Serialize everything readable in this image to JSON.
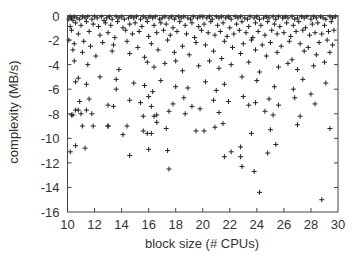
{
  "chart_data": {
    "type": "scatter",
    "title": "",
    "xlabel": "block size (# CPUs)",
    "ylabel": "complexity (MB/s)",
    "xlim": [
      10,
      30
    ],
    "ylim": [
      -16,
      0
    ],
    "xticks": [
      10,
      12,
      14,
      16,
      18,
      20,
      22,
      24,
      26,
      28,
      30
    ],
    "yticks": [
      0,
      -2,
      -4,
      -6,
      -8,
      -10,
      -12,
      -14,
      -16
    ],
    "grid": false,
    "legend": null,
    "marker": "+",
    "marker_color": "#222222",
    "series": [
      {
        "name": "points",
        "x": [
          10.1,
          10.2,
          10.3,
          10.4,
          10.5,
          10.7,
          10.9,
          11.1,
          11.3,
          11.5,
          11.8,
          12.0,
          12.2,
          12.5,
          12.7,
          12.9,
          13.1,
          13.3,
          13.6,
          13.8,
          14.0,
          14.2,
          14.5,
          14.7,
          14.9,
          15.1,
          15.4,
          15.6,
          15.8,
          16.1,
          16.3,
          16.5,
          16.8,
          17.0,
          17.2,
          17.5,
          17.7,
          17.9,
          18.2,
          18.4,
          18.6,
          18.9,
          19.1,
          19.3,
          19.6,
          19.8,
          20.0,
          20.3,
          20.5,
          20.7,
          21.0,
          21.2,
          21.4,
          21.7,
          21.9,
          22.1,
          22.4,
          22.6,
          22.8,
          23.1,
          23.3,
          23.5,
          23.8,
          24.0,
          24.2,
          24.5,
          24.7,
          24.9,
          25.2,
          25.4,
          25.6,
          25.9,
          26.1,
          26.3,
          26.6,
          26.8,
          27.0,
          27.3,
          27.5,
          27.7,
          28.0,
          28.2,
          28.4,
          28.7,
          28.9,
          29.1,
          29.4,
          29.6,
          29.8,
          10.2,
          10.6,
          11.0,
          11.4,
          11.9,
          12.3,
          12.8,
          13.2,
          13.7,
          14.1,
          14.6,
          15.0,
          15.5,
          15.9,
          16.4,
          16.9,
          17.3,
          17.8,
          18.3,
          18.7,
          19.2,
          19.7,
          20.1,
          20.6,
          21.1,
          21.5,
          22.0,
          22.5,
          22.9,
          23.4,
          23.9,
          24.3,
          24.8,
          25.3,
          25.7,
          26.2,
          26.7,
          27.1,
          27.6,
          28.1,
          28.5,
          29.0,
          29.5,
          10.3,
          10.8,
          11.6,
          12.4,
          13.0,
          13.5,
          14.3,
          14.8,
          15.3,
          16.0,
          16.6,
          17.1,
          17.6,
          18.1,
          18.8,
          19.4,
          19.9,
          20.4,
          20.9,
          21.3,
          21.8,
          22.3,
          22.7,
          23.2,
          23.7,
          24.1,
          24.6,
          25.1,
          25.5,
          26.0,
          26.5,
          26.9,
          27.4,
          27.9,
          28.3,
          28.8,
          29.3,
          29.7,
          10.1,
          10.5,
          11.2,
          11.7,
          12.6,
          13.4,
          14.4,
          15.2,
          16.2,
          17.4,
          18.5,
          19.5,
          20.2,
          21.6,
          22.2,
          23.0,
          23.6,
          24.4,
          25.0,
          25.8,
          26.4,
          27.2,
          27.8,
          28.6,
          29.2,
          29.6,
          10.4,
          11.1,
          12.1,
          13.3,
          14.6,
          15.7,
          16.7,
          17.9,
          18.0,
          19.0,
          20.8,
          21.4,
          22.8,
          23.9,
          24.7,
          25.5,
          26.6,
          27.5,
          28.4,
          29.4,
          10.5,
          11.5,
          13.8,
          15.9,
          16.4,
          17.2,
          18.5,
          19.7,
          20.5,
          21.2,
          22.1,
          23.4,
          24.2,
          25.6,
          26.3,
          27.0,
          28.2,
          29.0,
          10.6,
          10.8,
          11.4,
          12.4,
          13.6,
          13.6,
          14.9,
          15.7,
          16.3,
          16.9,
          18.0,
          18.9,
          20.2,
          21.0,
          21.6,
          22.9,
          24.0,
          25.3,
          26.7,
          27.4,
          28.0,
          29.1,
          10.9,
          11.6,
          13.0,
          14.6,
          15.4,
          16.0,
          17.8,
          18.6,
          19.2,
          20.8,
          21.9,
          23.0,
          23.9,
          24.9,
          25.6,
          26.8,
          28.3,
          10.3,
          10.8,
          11.8,
          13.4,
          15.6,
          16.6,
          17.5,
          18.7,
          19.8,
          21.2,
          23.4,
          24.6,
          25.2,
          27.2,
          11.1,
          11.9,
          13.0,
          14.1,
          15.6,
          16.2,
          16.6,
          17.3,
          19.5,
          20.9,
          21.5,
          23.6,
          25.0,
          27.0,
          29.4,
          10.2,
          10.6,
          11.3,
          14.6,
          16.0,
          17.4,
          21.6,
          22.8,
          24.8,
          25.4,
          10.4,
          10.6,
          11.0,
          11.4,
          13.0,
          14.4,
          15.9,
          16.2,
          16.4,
          17.5,
          20.1,
          22.1,
          22.8,
          22.9,
          23.8,
          24.2,
          28.8
        ],
        "y": [
          -0.3,
          -0.1,
          -0.2,
          -0.4,
          -0.1,
          -0.2,
          -0.3,
          -0.1,
          -0.2,
          -0.1,
          -0.3,
          -0.1,
          -0.2,
          -0.1,
          -0.4,
          -0.2,
          -0.1,
          -0.3,
          -0.1,
          -0.2,
          -0.1,
          -0.3,
          -0.2,
          -0.1,
          -0.2,
          -0.1,
          -0.3,
          -0.1,
          -0.2,
          -0.1,
          -0.2,
          -0.1,
          -0.3,
          -0.2,
          -0.1,
          -0.2,
          -0.1,
          -0.3,
          -0.1,
          -0.2,
          -0.1,
          -0.2,
          -0.3,
          -0.1,
          -0.2,
          -0.1,
          -0.1,
          -0.2,
          -0.1,
          -0.3,
          -0.1,
          -0.2,
          -0.1,
          -0.2,
          -0.1,
          -0.3,
          -0.1,
          -0.2,
          -0.1,
          -0.2,
          -0.3,
          -0.1,
          -0.2,
          -0.1,
          -0.3,
          -0.2,
          -0.1,
          -0.2,
          -0.1,
          -0.3,
          -0.1,
          -0.2,
          -0.1,
          -0.2,
          -0.1,
          -0.3,
          -0.2,
          -0.1,
          -0.2,
          -0.1,
          -0.3,
          -0.1,
          -0.2,
          -0.1,
          -0.2,
          -0.3,
          -0.1,
          -0.2,
          -0.1,
          -0.9,
          -0.6,
          -0.8,
          -0.5,
          -0.7,
          -0.9,
          -0.6,
          -0.8,
          -0.5,
          -1.0,
          -0.7,
          -0.6,
          -0.9,
          -0.5,
          -0.8,
          -0.6,
          -0.7,
          -1.0,
          -0.5,
          -0.8,
          -0.6,
          -0.9,
          -0.7,
          -0.5,
          -0.8,
          -0.6,
          -1.0,
          -0.7,
          -0.5,
          -0.9,
          -0.6,
          -0.8,
          -0.5,
          -0.7,
          -0.9,
          -0.6,
          -0.8,
          -0.5,
          -1.0,
          -0.7,
          -0.6,
          -0.8,
          -0.5,
          -1.2,
          -1.5,
          -1.3,
          -1.6,
          -1.4,
          -1.8,
          -1.2,
          -1.5,
          -1.3,
          -1.7,
          -1.4,
          -1.2,
          -1.6,
          -1.3,
          -1.5,
          -1.8,
          -1.2,
          -1.4,
          -1.6,
          -1.3,
          -1.7,
          -1.5,
          -1.2,
          -1.4,
          -1.8,
          -1.3,
          -1.6,
          -1.2,
          -1.5,
          -1.4,
          -1.7,
          -1.3,
          -1.2,
          -1.6,
          -1.4,
          -1.5,
          -1.3,
          -1.2,
          -2.0,
          -2.3,
          -2.1,
          -2.5,
          -2.2,
          -2.4,
          -2.1,
          -2.6,
          -2.3,
          -2.0,
          -2.5,
          -2.2,
          -2.4,
          -2.1,
          -2.6,
          -2.3,
          -2.0,
          -2.4,
          -2.2,
          -2.5,
          -2.1,
          -2.3,
          -2.6,
          -2.2,
          -2.0,
          -2.4,
          -2.8,
          -3.0,
          -3.3,
          -2.9,
          -3.1,
          -3.4,
          -2.8,
          -3.0,
          -3.7,
          -3.2,
          -2.9,
          -3.5,
          -3.1,
          -2.8,
          -3.3,
          -3.0,
          -3.6,
          -2.9,
          -3.2,
          -3.0,
          -3.7,
          -4.0,
          -4.4,
          -3.8,
          -4.2,
          -3.9,
          -4.5,
          -4.1,
          -3.7,
          -4.3,
          -4.0,
          -3.8,
          -4.6,
          -4.2,
          -3.9,
          -4.4,
          -4.1,
          -3.8,
          -5.4,
          -5.1,
          -5.6,
          -5.0,
          -5.2,
          -6.0,
          -5.5,
          -5.7,
          -6.2,
          -5.3,
          -5.8,
          -5.9,
          -5.4,
          -6.1,
          -5.6,
          -5.0,
          -5.3,
          -5.8,
          -6.0,
          -5.2,
          -6.4,
          -5.5,
          -7.0,
          -6.8,
          -7.3,
          -6.9,
          -7.1,
          -6.6,
          -7.2,
          -6.7,
          -7.4,
          -6.9,
          -7.0,
          -6.6,
          -7.1,
          -6.8,
          -7.3,
          -6.7,
          -7.2,
          -8.1,
          -7.7,
          -8.0,
          -7.4,
          -8.2,
          -8.1,
          -7.8,
          -8.0,
          -7.6,
          -7.9,
          -7.3,
          -7.8,
          -8.1,
          -8.2,
          -9.0,
          -9.0,
          -9.0,
          -9.7,
          -9.4,
          -9.6,
          -8.7,
          -9.2,
          -9.4,
          -9.1,
          -8.8,
          -9.6,
          -9.3,
          -8.9,
          -9.2,
          -11.1,
          -10.6,
          -10.8,
          -11.4,
          -10.9,
          -11.0,
          -11.5,
          -10.7,
          -11.2,
          -10.5,
          -8.1,
          -7.7,
          -8.0,
          -7.7,
          -9.0,
          -9.0,
          -9.6,
          -7.4,
          -8.2,
          -12.5,
          -9.4,
          -11.1,
          -11.5,
          -12.3,
          -12.7,
          -14.4,
          -15.0
        ]
      }
    ]
  },
  "axes": {
    "xlabel": "block size (# CPUs)",
    "ylabel": "complexity (MB/s)",
    "xtick_labels": [
      "10",
      "12",
      "14",
      "16",
      "18",
      "20",
      "22",
      "24",
      "26",
      "28",
      "30"
    ],
    "ytick_labels": [
      "0",
      "-2",
      "-4",
      "-6",
      "-8",
      "-10",
      "-12",
      "-14",
      "-16"
    ]
  }
}
